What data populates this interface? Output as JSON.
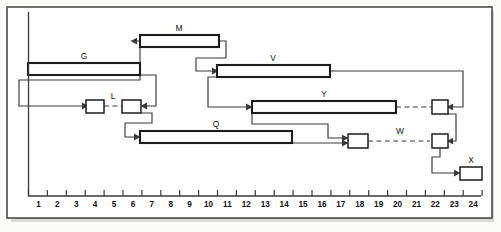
{
  "axis": {
    "name": "time-axis",
    "origin_x": 28.5,
    "unit_px": 18.9,
    "y": 196,
    "min": 1,
    "max": 24,
    "ticks": [
      1,
      2,
      3,
      4,
      5,
      6,
      7,
      8,
      9,
      10,
      11,
      12,
      13,
      14,
      15,
      16,
      17,
      18,
      19,
      20,
      21,
      22,
      23,
      24
    ],
    "labels": [
      "1",
      "2",
      "3",
      "4",
      "5",
      "6",
      "7",
      "8",
      "9",
      "10",
      "11",
      "12",
      "13",
      "14",
      "15",
      "16",
      "17",
      "18",
      "19",
      "20",
      "21",
      "22",
      "23",
      "24"
    ]
  },
  "colors": {
    "bar_stroke": "#1c1c1c",
    "bar_fill": "#ffffff",
    "link": "#3a3a3a",
    "frame": "#4a4a48",
    "page": "#fbfbfa",
    "text": "#111111"
  },
  "bars": [
    {
      "id": "G",
      "label": "G",
      "start": 0,
      "end": 6,
      "x": 28,
      "w": 112,
      "y": 63,
      "h": 12,
      "label_x": 84,
      "label_y": 59
    },
    {
      "id": "M",
      "label": "M",
      "start": 6,
      "end": 10,
      "x": 140,
      "w": 79,
      "y": 35,
      "h": 12,
      "label_x": 179,
      "label_y": 31
    },
    {
      "id": "V",
      "label": "V",
      "start": 10,
      "end": 16,
      "x": 217,
      "w": 113,
      "y": 65,
      "h": 12,
      "label_x": 273,
      "label_y": 61
    },
    {
      "id": "Y",
      "label": "Y",
      "start": 12,
      "end": 19.5,
      "x": 252,
      "w": 144,
      "y": 101,
      "h": 12,
      "label_x": 324,
      "label_y": 97
    },
    {
      "id": "Q",
      "label": "Q",
      "start": 6,
      "end": 14,
      "x": 140,
      "w": 152,
      "y": 131,
      "h": 12,
      "label_x": 216,
      "label_y": 127
    }
  ],
  "nodes": [
    {
      "id": "n1",
      "label": "",
      "x": 86,
      "y": 100,
      "w": 18,
      "h": 13
    },
    {
      "id": "n2",
      "label": "",
      "x": 122,
      "y": 100,
      "w": 19,
      "h": 13
    },
    {
      "id": "n3",
      "label": "",
      "x": 432,
      "y": 100,
      "w": 16,
      "h": 14
    },
    {
      "id": "n4",
      "label": "",
      "x": 348,
      "y": 134,
      "w": 20,
      "h": 14
    },
    {
      "id": "n5",
      "label": "",
      "x": 432,
      "y": 134,
      "w": 16,
      "h": 14
    },
    {
      "id": "X",
      "label": "X",
      "x": 460,
      "y": 167,
      "w": 22,
      "h": 13
    }
  ],
  "dashed_links": [
    {
      "id": "L",
      "label": "L",
      "x1": 104,
      "x2": 122,
      "y": 106,
      "label_x": 113,
      "label_y": 98
    },
    {
      "id": "YtoN3",
      "label": "",
      "x1": 396,
      "x2": 432,
      "y": 107,
      "label_x": 0,
      "label_y": 0
    },
    {
      "id": "W",
      "label": "W",
      "x1": 368,
      "x2": 432,
      "y": 141,
      "label_x": 400,
      "label_y": 133
    }
  ],
  "node_labels": [
    {
      "id": "X-label",
      "text": "X",
      "x": 471,
      "y": 163
    }
  ]
}
